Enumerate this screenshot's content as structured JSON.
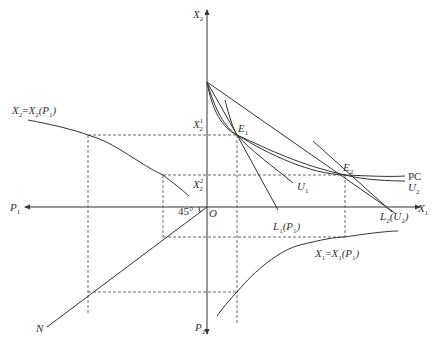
{
  "diagram": {
    "axes": {
      "x2_top": {
        "main": "X",
        "sub": "2"
      },
      "x1_right": {
        "main": "X",
        "sub": "1"
      },
      "p1_left": {
        "main": "P",
        "sub": "1"
      },
      "p2_bottom": {
        "main": "P",
        "sub": "2"
      },
      "origin": "O"
    },
    "levels": {
      "x2_1": {
        "main": "X",
        "sub": "2",
        "sup": "1"
      },
      "x2_2": {
        "main": "X",
        "sub": "2",
        "sup": "2"
      }
    },
    "points": {
      "e1": {
        "main": "E",
        "sub": "1"
      },
      "e2": {
        "main": "E",
        "sub": "2"
      }
    },
    "curves": {
      "pc": "PC",
      "u1": {
        "main": "U",
        "sub": "1"
      },
      "u2": {
        "main": "U",
        "sub": "2"
      },
      "l1": {
        "main": "L",
        "sub": "1",
        "arg_main": "P",
        "arg_sub": "1"
      },
      "l2": {
        "main": "L",
        "sub": "2",
        "arg_main": "U",
        "arg_sub": "2"
      },
      "x2_func": {
        "lhs_main": "X",
        "lhs_sub": "2",
        "eq": "=",
        "rhs_main": "X",
        "rhs_sub": "2",
        "arg_main": "P",
        "arg_sub": "1"
      },
      "x1_func": {
        "lhs_main": "X",
        "lhs_sub": "1",
        "eq": "=",
        "rhs_main": "X",
        "rhs_sub": "1",
        "arg_main": "P",
        "arg_sub": "1"
      },
      "n_line": "N",
      "angle": "45°"
    },
    "punct": {
      "open": "(",
      "close": ")"
    }
  }
}
